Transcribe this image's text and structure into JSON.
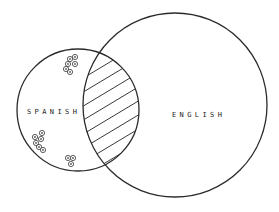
{
  "diagram": {
    "type": "venn",
    "sets": [
      {
        "id": "spanish",
        "label": "SPANISH",
        "cx": 78,
        "cy": 110,
        "r": 61,
        "label_x": 27,
        "label_y": 114
      },
      {
        "id": "english",
        "label": "ENGLISH",
        "cx": 175,
        "cy": 105,
        "r": 92,
        "label_x": 172,
        "label_y": 117
      }
    ],
    "intersection": {
      "between": [
        "spanish",
        "english"
      ],
      "fill": "hatched"
    },
    "marker_clusters": [
      {
        "name": "top-cluster",
        "set": "spanish",
        "markers": [
          [
            70,
            59
          ],
          [
            75,
            57
          ],
          [
            67,
            63
          ],
          [
            74,
            64
          ],
          [
            66,
            69
          ],
          [
            70,
            72
          ]
        ]
      },
      {
        "name": "bottom-left-cluster",
        "set": "spanish",
        "markers": [
          [
            41,
            133
          ],
          [
            35,
            137
          ],
          [
            41,
            139
          ],
          [
            36,
            143
          ],
          [
            39,
            147
          ],
          [
            43,
            150
          ]
        ]
      },
      {
        "name": "bottom-cluster",
        "set": "spanish",
        "markers": [
          [
            68,
            158
          ],
          [
            73,
            158
          ],
          [
            71,
            164
          ]
        ]
      }
    ],
    "colors": {
      "background": "#ffffff",
      "stroke": "#2a2a2a"
    }
  }
}
